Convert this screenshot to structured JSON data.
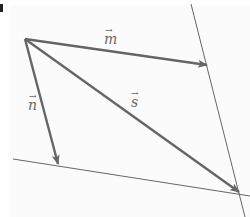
{
  "diagram": {
    "type": "vector-parallelogram",
    "colors": {
      "vector": "#666666",
      "line": "#666666",
      "background": "#fbfbfb"
    },
    "origin": [
      25,
      39
    ],
    "vectors": [
      {
        "name": "m",
        "label": "m",
        "from": [
          25,
          39
        ],
        "to": [
          208,
          65
        ]
      },
      {
        "name": "n",
        "label": "n",
        "from": [
          25,
          39
        ],
        "to": [
          58,
          165
        ]
      },
      {
        "name": "s",
        "label": "s",
        "from": [
          25,
          39
        ],
        "to": [
          240,
          193
        ]
      }
    ],
    "lines": [
      {
        "name": "right-line",
        "from": [
          191,
          4
        ],
        "to": [
          245,
          217
        ]
      },
      {
        "name": "bottom-line",
        "from": [
          13,
          159
        ],
        "to": [
          250,
          196
        ]
      }
    ],
    "labels": {
      "m": "m",
      "n": "n",
      "s": "s",
      "arrow": "→"
    }
  }
}
